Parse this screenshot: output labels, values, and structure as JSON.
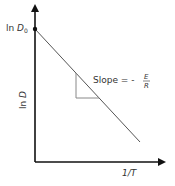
{
  "diagram": {
    "y_axis_label": "ln D",
    "y_intercept_label_prefix": "ln ",
    "y_intercept_label_var": "D",
    "y_intercept_label_sub": "0",
    "x_axis_label": "1/T",
    "slope_label_prefix": "Slope = -",
    "slope_numerator": "E",
    "slope_denominator": "R",
    "colors": {
      "axis": "#111111",
      "line": "#555555",
      "triangle": "#888888",
      "text": "#333333"
    }
  }
}
